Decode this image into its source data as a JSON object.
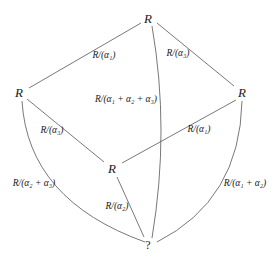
{
  "nodes": {
    "top": {
      "label": "R",
      "x": 148,
      "y": 18
    },
    "left": {
      "label": "R",
      "x": 19,
      "y": 92
    },
    "right": {
      "label": "R",
      "x": 242,
      "y": 92
    },
    "middle": {
      "label": "R",
      "x": 112,
      "y": 168
    },
    "bottom": {
      "label": "?",
      "x": 148,
      "y": 245
    }
  },
  "edges": [
    {
      "id": "top-left",
      "label": "R/(α₁)"
    },
    {
      "id": "top-right",
      "label": "R/(α₃)"
    },
    {
      "id": "top-bottom",
      "label": "R/(α₁ + α₂ + α₃)"
    },
    {
      "id": "left-middle",
      "label": "R/(α₃)"
    },
    {
      "id": "right-middle",
      "label": "R/(α₁)"
    },
    {
      "id": "left-bottom",
      "label": "R/(α₂ + α₃)"
    },
    {
      "id": "middle-bottom",
      "label": "R/(α₂)"
    },
    {
      "id": "right-bottom",
      "label": "R/(α₁ + α₂)"
    }
  ],
  "colors": {
    "line": "#555555",
    "text": "#1a1a1a",
    "background": "#ffffff"
  }
}
